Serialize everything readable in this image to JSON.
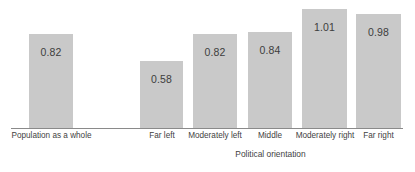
{
  "chart_data": {
    "type": "bar",
    "title": "",
    "subtitle": "",
    "xlabel": "Political orientation",
    "ylabel": "",
    "ylim": [
      0,
      1.15
    ],
    "grid": false,
    "legend": false,
    "legend_position": "none",
    "orientation": "vertical",
    "bar_color": "#c9c9c9",
    "axis_color": "#8a8a8a",
    "label_color": "#3f3f3f",
    "value_label_color": "#3d3d3d",
    "categories": [
      "Population as a whole",
      "",
      "Far left",
      "Moderately left",
      "Middle",
      "Moderately right",
      "Far right"
    ],
    "values": [
      0.82,
      null,
      0.58,
      0.82,
      0.84,
      1.01,
      0.98
    ],
    "value_labels": [
      "0.82",
      "",
      "0.58",
      "0.82",
      "0.84",
      "1.01",
      "0.98"
    ],
    "bars": [
      {
        "category": "Population as a whole",
        "value": 0.82,
        "value_label": "0.82",
        "has_bar": true,
        "left": 29,
        "width": 44,
        "height": 95,
        "label_left": 8,
        "label_width": 87
      },
      {
        "category": "",
        "value": null,
        "value_label": "",
        "has_bar": false,
        "left": 86,
        "width": 44,
        "height": 0,
        "label_left": 86,
        "label_width": 44
      },
      {
        "category": "Far left",
        "value": 0.58,
        "value_label": "0.58",
        "has_bar": true,
        "left": 140,
        "width": 43,
        "height": 68,
        "label_left": 136,
        "label_width": 52
      },
      {
        "category": "Moderately left",
        "value": 0.82,
        "value_label": "0.82",
        "has_bar": true,
        "left": 193,
        "width": 44,
        "height": 95,
        "label_left": 185,
        "label_width": 60
      },
      {
        "category": "Middle",
        "value": 0.84,
        "value_label": "0.84",
        "has_bar": true,
        "left": 248,
        "width": 44,
        "height": 97,
        "label_left": 246,
        "label_width": 48
      },
      {
        "category": "Moderately right",
        "value": 1.01,
        "value_label": "1.01",
        "has_bar": true,
        "left": 302,
        "width": 45,
        "height": 120,
        "label_left": 292,
        "label_width": 66
      },
      {
        "category": "Far right",
        "value": 0.98,
        "value_label": "0.98",
        "has_bar": true,
        "left": 356,
        "width": 45,
        "height": 115,
        "label_left": 352,
        "label_width": 53
      }
    ]
  }
}
